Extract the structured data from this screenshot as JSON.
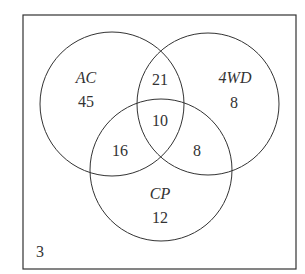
{
  "diagram": {
    "type": "venn",
    "universal_count": "3",
    "sets": [
      {
        "name": "AC",
        "only": "45"
      },
      {
        "name": "4WD",
        "only": "8"
      },
      {
        "name": "CP",
        "only": "12"
      }
    ],
    "regions": {
      "AC_4WD_only": "21",
      "AC_CP_only": "16",
      "4WD_CP_only": "8",
      "all_three": "10"
    },
    "colors": {
      "stroke": "#333333",
      "background": "#ffffff"
    }
  }
}
